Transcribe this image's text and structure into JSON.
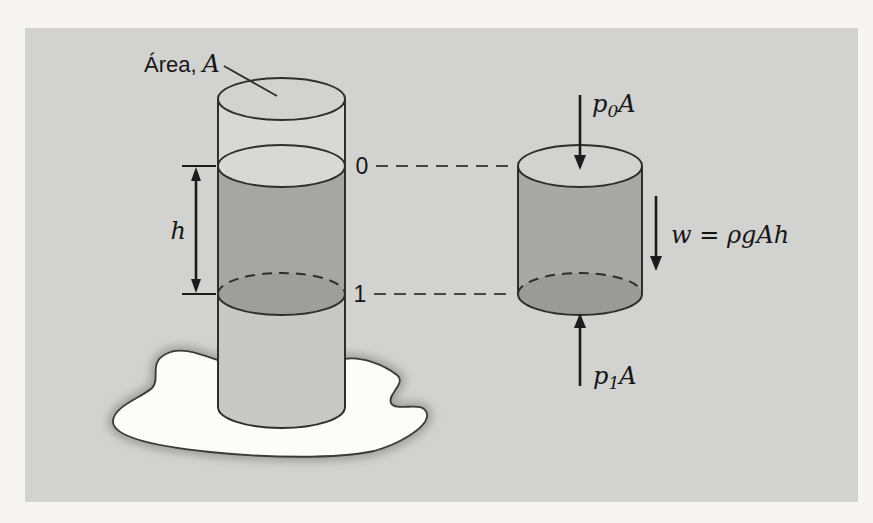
{
  "figure": {
    "labels": {
      "area_prefix": "Área,",
      "area_var": "A",
      "level_top": "0",
      "level_bottom": "1",
      "height": "h",
      "p_top": {
        "base": "p",
        "sub": "0",
        "factor": "A"
      },
      "weight": "w = ρgAh",
      "p_bottom": {
        "base": "p",
        "sub": "1",
        "factor": "A"
      }
    },
    "colors": {
      "page_bg": "#f6f5f2",
      "panel_bg": "#d2d2d0",
      "tube_empty": "#d8d8d6",
      "tube_top_face": "#d5d5d3",
      "fluid_surface": "#d7d7d5",
      "fluid_side": "#a6a6a4",
      "fluid_bottom_face": "#9e9e9c",
      "tube_lower": "#c8c8c6",
      "element_top_face": "#d7d7d5",
      "element_side": "#a8a8a6",
      "element_bottom_face": "#9a9a98",
      "puddle_fill": "#fcfcfa",
      "puddle_shadow": "#a0a09e",
      "ink": "#1c1c1c"
    }
  }
}
